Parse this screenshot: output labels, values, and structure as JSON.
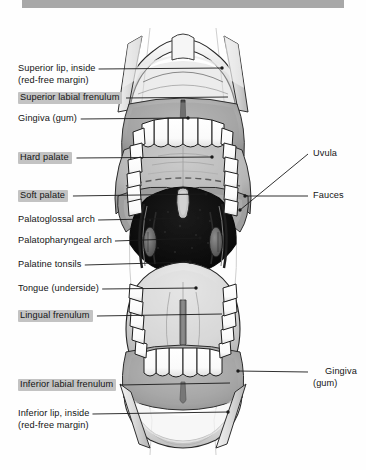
{
  "figure": {
    "topbar_color": "#a8a8a8",
    "highlight_color": "#c3c3c3",
    "ink_color": "#141414"
  },
  "labels_left": [
    {
      "id": "superior-lip-inside",
      "line1": "Superior lip, inside",
      "line2": "(red-free margin)",
      "highlight": false,
      "x": 18,
      "y": 63,
      "leader_x2": 222,
      "leader_y2": 68,
      "dot": true
    },
    {
      "id": "superior-labial-frenulum",
      "line1": "Superior labial frenulum",
      "line2": "",
      "highlight": true,
      "x": 18,
      "y": 92,
      "leader_x2": 228,
      "leader_y2": 97,
      "dot": false
    },
    {
      "id": "gingiva-gum-upper",
      "line1": "Gingiva (gum)",
      "line2": "",
      "highlight": false,
      "x": 18,
      "y": 113,
      "leader_x2": 188,
      "leader_y2": 118,
      "dot": true
    },
    {
      "id": "hard-palate",
      "line1": "Hard palate",
      "line2": "",
      "highlight": true,
      "x": 18,
      "y": 152,
      "leader_x2": 212,
      "leader_y2": 157,
      "dot": true
    },
    {
      "id": "soft-palate",
      "line1": "Soft palate",
      "line2": "",
      "highlight": true,
      "x": 18,
      "y": 190,
      "leader_x2": 206,
      "leader_y2": 194,
      "dot": true
    },
    {
      "id": "palatoglossal-arch",
      "line1": "Palatoglossal arch",
      "line2": "",
      "highlight": false,
      "x": 18,
      "y": 214,
      "leader_x2": 198,
      "leader_y2": 218,
      "dot": true
    },
    {
      "id": "palatopharyngeal-arch",
      "line1": "Palatopharyngeal arch",
      "line2": "",
      "highlight": false,
      "x": 18,
      "y": 235,
      "leader_x2": 200,
      "leader_y2": 238,
      "dot": true
    },
    {
      "id": "palatine-tonsils",
      "line1": "Palatine tonsils",
      "line2": "",
      "highlight": false,
      "x": 18,
      "y": 259,
      "leader_x2": 190,
      "leader_y2": 262,
      "dot": true
    },
    {
      "id": "tongue-underside",
      "line1": "Tongue (underside)",
      "line2": "",
      "highlight": false,
      "x": 18,
      "y": 283,
      "leader_x2": 196,
      "leader_y2": 288,
      "dot": true
    },
    {
      "id": "lingual-frenulum",
      "line1": "Lingual frenulum",
      "line2": "",
      "highlight": true,
      "x": 18,
      "y": 310,
      "leader_x2": 222,
      "leader_y2": 314,
      "dot": false
    },
    {
      "id": "inferior-labial-frenulum",
      "line1": "Inferior labial frenulum",
      "line2": "",
      "highlight": true,
      "x": 18,
      "y": 379,
      "leader_x2": 230,
      "leader_y2": 383,
      "dot": false
    },
    {
      "id": "inferior-lip-inside",
      "line1": "Inferior lip, inside",
      "line2": "(red-free margin)",
      "highlight": false,
      "x": 18,
      "y": 408,
      "leader_x2": 228,
      "leader_y2": 412,
      "dot": true
    }
  ],
  "labels_right": [
    {
      "id": "uvula",
      "line1": "Uvula",
      "line2": "",
      "x": 313,
      "y": 148,
      "leader_x2": 240,
      "leader_y2": 210,
      "dot": true
    },
    {
      "id": "fauces",
      "line1": "Fauces",
      "line2": "",
      "x": 313,
      "y": 190,
      "leader_x2": 245,
      "leader_y2": 196,
      "dot": true
    },
    {
      "id": "gingiva-gum-lower",
      "line1": "Gingiva",
      "line2": "(gum)",
      "x": 313,
      "y": 366,
      "leader_x2": 238,
      "leader_y2": 371,
      "dot": true
    }
  ],
  "structures": [
    "superior lip retracted",
    "upper gingiva",
    "upper incisors and canines",
    "hard palate with transverse rugae",
    "soft palate",
    "uvula",
    "palatoglossal arch",
    "palatopharyngeal arch",
    "palatine tonsil",
    "oropharynx / fauces opening",
    "tongue underside with lingual frenulum",
    "sublingual folds",
    "lower incisors and canines",
    "lower gingiva",
    "inferior lip retracted"
  ]
}
